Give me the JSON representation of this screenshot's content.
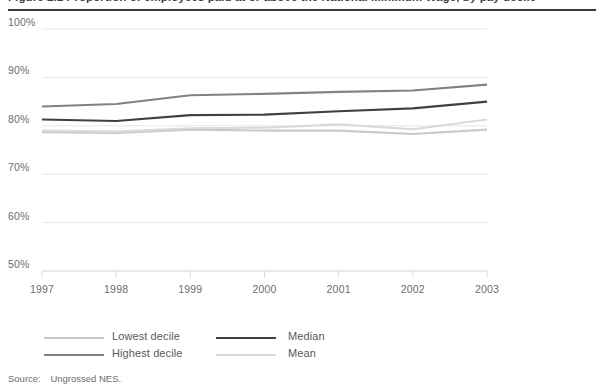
{
  "figure": {
    "title": "Figure 2.1  Proportion of employees paid at or above the National Minimum Wage, by pay decile",
    "source_label": "Source:",
    "source_value": "Ungrossed NES."
  },
  "chart_data": {
    "type": "line",
    "title": "",
    "xlabel": "",
    "ylabel": "",
    "x": [
      "1997",
      "1998",
      "1999",
      "2000",
      "2001",
      "2002",
      "2003"
    ],
    "xtick_labels": [
      "1997",
      "1998",
      "1999",
      "2000",
      "2001",
      "2002",
      "2003"
    ],
    "ytick_labels": [
      "50%",
      "60%",
      "70%",
      "80%",
      "90%",
      "100%"
    ],
    "ytick_values": [
      50,
      60,
      70,
      80,
      90,
      100
    ],
    "ylim": [
      50,
      100
    ],
    "grid": "horizontal",
    "legend_position": "bottom-left",
    "series": [
      {
        "name": "Lowest decile",
        "color": "#c9c9c9",
        "values": [
          78.7,
          78.5,
          79.2,
          79.0,
          79.0,
          78.3,
          79.2
        ]
      },
      {
        "name": "Highest decile",
        "color": "#808285",
        "values": [
          84.0,
          84.5,
          86.3,
          86.6,
          87.0,
          87.3,
          88.5
        ]
      },
      {
        "name": "Median",
        "color": "#404042",
        "values": [
          81.3,
          81.0,
          82.2,
          82.3,
          83.0,
          83.6,
          85.0
        ]
      },
      {
        "name": "Mean",
        "color": "#d9d9d9",
        "values": [
          79.0,
          78.8,
          79.5,
          79.6,
          80.3,
          79.3,
          81.3
        ]
      }
    ]
  },
  "legend": {
    "items": [
      {
        "label": "Lowest decile",
        "color": "#c9c9c9"
      },
      {
        "label": "Highest decile",
        "color": "#808285"
      },
      {
        "label": "Median",
        "color": "#404042"
      },
      {
        "label": "Mean",
        "color": "#d9d9d9"
      }
    ]
  }
}
